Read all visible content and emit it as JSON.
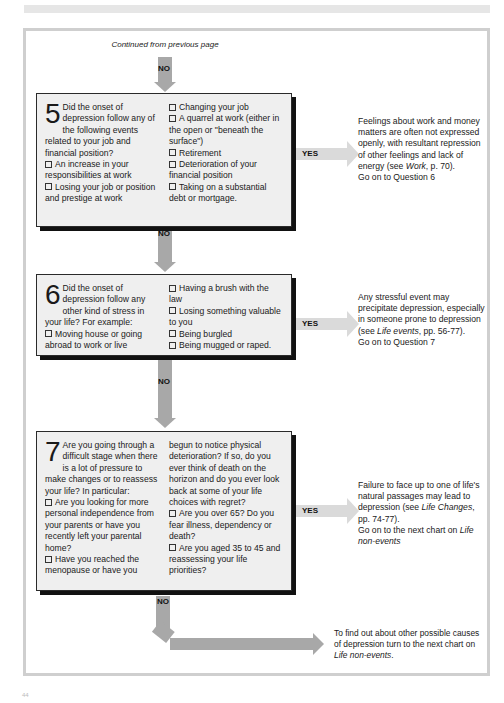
{
  "header": {
    "continued_label": "Continued from previous page"
  },
  "colors": {
    "box_fill": "#efefef",
    "box_border": "#2a2a2a",
    "arrow_no": "#a8a8a8",
    "arrow_yes": "#dadada",
    "frame_border": "#cfcfcf"
  },
  "flow": {
    "no_label": "NO",
    "yes_label": "YES"
  },
  "questions": [
    {
      "number": "5",
      "intro": "Did the onset of depression follow any of the following events related to your job and financial position?",
      "left_items": [
        "An increase in your responsibilities at work",
        "Losing your job or position and prestige at work"
      ],
      "right_items": [
        "Changing your job",
        "A quarrel at work (either in the open or \"beneath the surface\")",
        "Retirement",
        "Deterioration of your financial position",
        "Taking on a substantial debt or mortgage."
      ],
      "yes_outcome": {
        "text_before": "Feelings about work and money matters are often not expressed openly, with resultant repression of other feelings and lack of energy (see ",
        "ref_italic": "Work",
        "text_after": ", p. 70).",
        "next": "Go on to Question 6"
      }
    },
    {
      "number": "6",
      "intro": "Did the onset of depression follow any other kind of stress in your life? For example:",
      "left_items": [
        "Moving house or going abroad to work or live"
      ],
      "right_items": [
        "Having a brush with the law",
        "Losing something valuable to you",
        "Being burgled",
        "Being mugged or raped."
      ],
      "yes_outcome": {
        "text_before": "Any stressful event may precipitate depression, especially in someone prone to depression (see ",
        "ref_italic": "Life events",
        "text_after": ", pp. 56-77).",
        "next": "Go on to Question 7"
      }
    },
    {
      "number": "7",
      "intro": "Are you going through a difficult stage when there is a lot of pressure to make changes or to reassess your life? In particular:",
      "left_items": [
        "Are you looking for more personal independence from your parents or have you recently left your parental home?",
        "Have you reached the menopause or have you"
      ],
      "right_continuation": "begun to notice physical deterioration? If so, do you ever think of death on the horizon and do you ever look back at some of your life choices with regret?",
      "right_items": [
        "Are you over 65? Do you fear illness, dependency or death?",
        "Are you aged 35 to 45 and reassessing your life priorities?"
      ],
      "yes_outcome": {
        "text_before": "Failure to face up to one of life's natural passages may lead to depression (see ",
        "ref_italic": "Life Changes",
        "text_after": ", pp. 74-77).",
        "next_before": "Go on to the next chart on ",
        "next_italic": "Life non-events"
      }
    }
  ],
  "final_outcome": {
    "text_before": "To find out about other possible causes of depression turn to the next chart on ",
    "ref_italic": "Life non-events",
    "text_after": "."
  },
  "footer": {
    "page_number": "44"
  }
}
